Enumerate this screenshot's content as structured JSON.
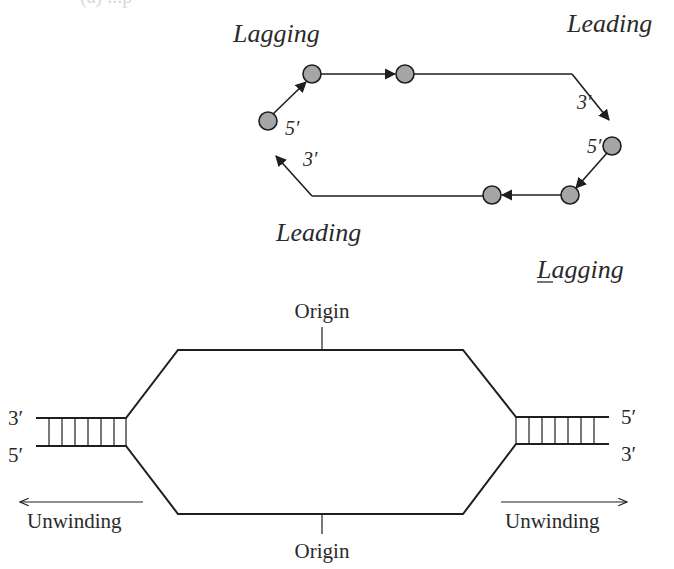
{
  "cropped_header": {
    "text": "(a) ...p"
  },
  "top_diagram": {
    "labels": {
      "lagging_top": "Lagging",
      "leading_top": "Leading",
      "leading_bottom": "Leading",
      "lagging_bottom": "Lagging"
    },
    "end_labels": {
      "left_5prime": "5′",
      "left_3prime": "3′",
      "right_3prime": "3′",
      "right_5prime": "5′"
    },
    "circle_fill": "#a6a6a6",
    "stroke_color": "#1e1e1e",
    "primers": [
      {
        "id": "p1",
        "cx": 268,
        "cy": 121
      },
      {
        "id": "p2",
        "cx": 312,
        "cy": 74
      },
      {
        "id": "p3",
        "cx": 405,
        "cy": 74
      },
      {
        "id": "p4",
        "cx": 612,
        "cy": 146
      },
      {
        "id": "p5",
        "cx": 570,
        "cy": 195
      },
      {
        "id": "p6",
        "cx": 492,
        "cy": 195
      }
    ]
  },
  "bottom_diagram": {
    "origin_top": "Origin",
    "origin_bottom": "Origin",
    "left_fork": {
      "top_end": "3′",
      "bottom_end": "5′",
      "unwinding": "Unwinding"
    },
    "right_fork": {
      "top_end": "5′",
      "bottom_end": "3′",
      "unwinding": "Unwinding"
    },
    "rung_count": 7,
    "stroke_color": "#1e1e1e"
  }
}
